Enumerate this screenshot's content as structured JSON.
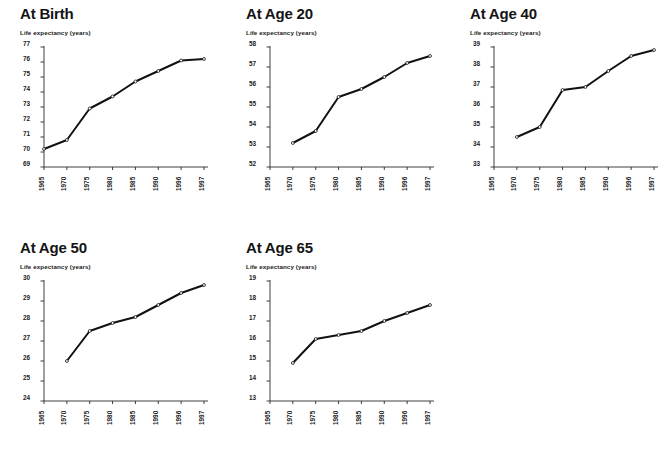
{
  "figure": {
    "background": "#ffffff",
    "line_color": "#111111",
    "axis_color": "#2a2a2a",
    "marker_color": "#ffffff"
  },
  "axis_label_text": "Life expectancy (years)",
  "chart_data": [
    {
      "type": "line",
      "title": "At Birth",
      "xlabel": "",
      "ylabel": "Life expectancy (years)",
      "categories": [
        "1965",
        "1970",
        "1975",
        "1980",
        "1985",
        "1990",
        "1996",
        "1997"
      ],
      "x_ticklabels": [
        "1965",
        "1970",
        "1975",
        "1980",
        "1985",
        "1990",
        "1996",
        "1997"
      ],
      "values": [
        70.2,
        70.8,
        72.9,
        73.7,
        74.7,
        75.4,
        76.1,
        76.2
      ],
      "y_ticklabels": [
        "69",
        "70",
        "71",
        "72",
        "73",
        "74",
        "75",
        "76",
        "77"
      ],
      "ylim": [
        69,
        77
      ],
      "grid": false,
      "legend": "none",
      "markers": "open-circle"
    },
    {
      "type": "line",
      "title": "At Age 20",
      "xlabel": "",
      "ylabel": "Life expectancy (years)",
      "categories": [
        "1965",
        "1970",
        "1975",
        "1980",
        "1985",
        "1990",
        "1996",
        "1997"
      ],
      "x_ticklabels": [
        "1965",
        "1970",
        "1975",
        "1980",
        "1985",
        "1990",
        "1996",
        "1997"
      ],
      "values": [
        null,
        53.2,
        53.8,
        55.5,
        55.9,
        56.5,
        57.2,
        57.55
      ],
      "y_ticklabels": [
        "52",
        "53",
        "54",
        "55",
        "56",
        "57",
        "58"
      ],
      "ylim": [
        52,
        58
      ],
      "grid": false,
      "legend": "none",
      "markers": "open-circle"
    },
    {
      "type": "line",
      "title": "At Age 40",
      "xlabel": "",
      "ylabel": "Life expectancy (years)",
      "categories": [
        "1965",
        "1970",
        "1975",
        "1980",
        "1985",
        "1990",
        "1996",
        "1997"
      ],
      "x_ticklabels": [
        "1965",
        "1970",
        "1975",
        "1980",
        "1985",
        "1990",
        "1996",
        "1997"
      ],
      "values": [
        null,
        34.5,
        35.0,
        36.85,
        37.0,
        37.8,
        38.55,
        38.85
      ],
      "y_ticklabels": [
        "33",
        "34",
        "35",
        "36",
        "37",
        "38",
        "39"
      ],
      "ylim": [
        33,
        39
      ],
      "grid": false,
      "legend": "none",
      "markers": "open-circle"
    },
    {
      "type": "line",
      "title": "At Age 50",
      "xlabel": "",
      "ylabel": "Life expectancy (years)",
      "categories": [
        "1965",
        "1970",
        "1975",
        "1980",
        "1985",
        "1990",
        "1996",
        "1997"
      ],
      "x_ticklabels": [
        "1965",
        "1970",
        "1975",
        "1980",
        "1985",
        "1990",
        "1996",
        "1997"
      ],
      "values": [
        null,
        26.0,
        27.5,
        27.9,
        28.2,
        28.8,
        29.4,
        29.8
      ],
      "y_ticklabels": [
        "24",
        "25",
        "26",
        "27",
        "28",
        "29",
        "30"
      ],
      "ylim": [
        24,
        30
      ],
      "grid": false,
      "legend": "none",
      "markers": "open-circle"
    },
    {
      "type": "line",
      "title": "At Age 65",
      "xlabel": "",
      "ylabel": "Life expectancy (years)",
      "categories": [
        "1965",
        "1970",
        "1975",
        "1980",
        "1985",
        "1990",
        "1996",
        "1997"
      ],
      "x_ticklabels": [
        "1965",
        "1970",
        "1975",
        "1980",
        "1985",
        "1990",
        "1996",
        "1997"
      ],
      "values": [
        null,
        14.9,
        16.1,
        16.3,
        16.5,
        17.0,
        17.4,
        17.8
      ],
      "y_ticklabels": [
        "13",
        "14",
        "15",
        "16",
        "17",
        "18",
        "19"
      ],
      "ylim": [
        13,
        19
      ],
      "grid": false,
      "legend": "none",
      "markers": "open-circle"
    }
  ],
  "panels": [
    {
      "left": 20,
      "top": 6,
      "plot_left": 36,
      "plot_top": 44,
      "plot_w": 160,
      "plot_h": 120
    },
    {
      "left": 246,
      "top": 6,
      "plot_left": 262,
      "plot_top": 44,
      "plot_w": 160,
      "plot_h": 120
    },
    {
      "left": 470,
      "top": 6,
      "plot_left": 486,
      "plot_top": 44,
      "plot_w": 160,
      "plot_h": 120
    },
    {
      "left": 20,
      "top": 240,
      "plot_left": 36,
      "plot_top": 278,
      "plot_w": 160,
      "plot_h": 120
    },
    {
      "left": 246,
      "top": 240,
      "plot_left": 262,
      "plot_top": 278,
      "plot_w": 160,
      "plot_h": 120
    }
  ]
}
